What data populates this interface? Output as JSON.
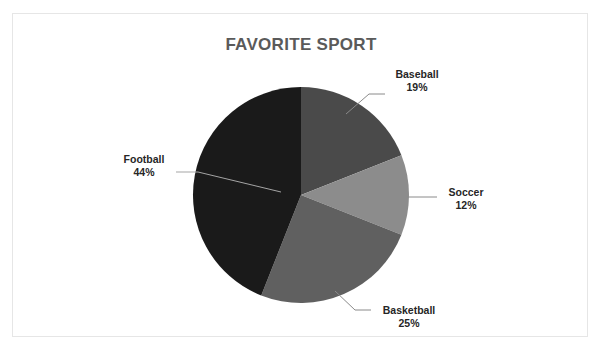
{
  "top_strip_text": " ",
  "chart_data": {
    "type": "pie",
    "title": "FAVORITE SPORT",
    "xlabel": "",
    "ylabel": "",
    "grid": false,
    "legend": "none",
    "labels_position": "outside-with-leader-lines",
    "start_angle_deg": 0,
    "direction": "clockwise",
    "categories": [
      "Baseball",
      "Soccer",
      "Basketball",
      "Football"
    ],
    "values": [
      19,
      12,
      25,
      44
    ],
    "value_unit": "%",
    "total": 100,
    "slices": [
      {
        "name": "Baseball",
        "value": 19,
        "display": "19%",
        "color": "#4a4a4a"
      },
      {
        "name": "Soccer",
        "value": 12,
        "display": "12%",
        "color": "#8c8c8c"
      },
      {
        "name": "Basketball",
        "value": 25,
        "display": "25%",
        "color": "#606060"
      },
      {
        "name": "Football",
        "value": 44,
        "display": "44%",
        "color": "#1a1a1a"
      }
    ],
    "colors": {
      "baseball": "#4a4a4a",
      "soccer": "#8c8c8c",
      "basketball": "#606060",
      "football": "#1a1a1a",
      "title_text": "#5a5a5a",
      "label_text": "#262626",
      "leader_line": "#7a7a7a",
      "frame_border": "#e6e6e6",
      "background": "#ffffff"
    },
    "geometry": {
      "center_x": 288,
      "center_y": 181,
      "radius": 108
    }
  }
}
